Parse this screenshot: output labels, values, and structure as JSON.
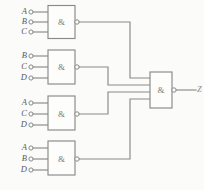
{
  "diagram": {
    "gate_symbol": "&",
    "colors": {
      "background": "#fbfbf9",
      "line": "#8a8a8a",
      "text": "#5a5a5a"
    },
    "gates": [
      {
        "id": "gate-1",
        "symbol": "&",
        "inputs": [
          "A",
          "B",
          "C"
        ]
      },
      {
        "id": "gate-2",
        "symbol": "&",
        "inputs": [
          "B",
          "C",
          "D"
        ]
      },
      {
        "id": "gate-3",
        "symbol": "&",
        "inputs": [
          "A",
          "C",
          "D"
        ]
      },
      {
        "id": "gate-4",
        "symbol": "&",
        "inputs": [
          "A",
          "B",
          "D"
        ]
      }
    ],
    "output_gate": {
      "id": "gate-out",
      "symbol": "&",
      "input_count": 4
    },
    "output": {
      "label": "Z"
    }
  }
}
